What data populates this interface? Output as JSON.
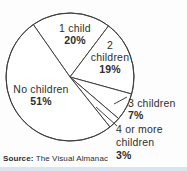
{
  "chart_data": {
    "type": "pie",
    "categories": [
      "1 child",
      "2 children",
      "3 children",
      "4 or more children",
      "No children"
    ],
    "values": [
      20,
      19,
      7,
      3,
      51
    ],
    "unit": "%",
    "start_angle_deg": 125,
    "direction": "clockwise",
    "geometry": {
      "cx": 70,
      "cy": 77,
      "r": 64
    },
    "colors": {
      "slice_fill": "#ffffff",
      "line": "#3f3f3f",
      "text": "#2e2e2e",
      "footer_bar": "#d8e4f0"
    },
    "source": "The Visual Almanac"
  },
  "labels": {
    "one_child": {
      "name": "1 child",
      "pct": "20%"
    },
    "two_children": {
      "line1": "2",
      "line2": "children",
      "pct": "19%"
    },
    "three_children": {
      "name": "3 children",
      "pct": "7%"
    },
    "four_plus": {
      "line1": "4 or more",
      "line2": "children",
      "pct": "3%"
    },
    "no_children": {
      "name": "No children",
      "pct": "51%"
    }
  },
  "source": {
    "prefix": "Source:",
    "text": " The Visual Almanac"
  }
}
